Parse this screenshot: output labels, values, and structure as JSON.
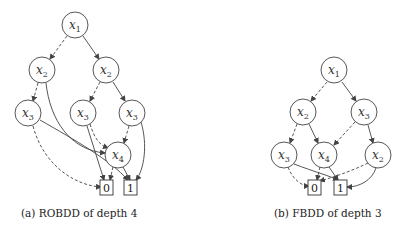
{
  "figures": [
    {
      "id": "a",
      "caption": "(a) ROBDD of depth 4",
      "nodes": [
        {
          "id": "a_x1",
          "var": "x",
          "sub": "1",
          "cx": 75,
          "cy": 25
        },
        {
          "id": "a_x2l",
          "var": "x",
          "sub": "2",
          "cx": 42,
          "cy": 70
        },
        {
          "id": "a_x2r",
          "var": "x",
          "sub": "2",
          "cx": 106,
          "cy": 70
        },
        {
          "id": "a_x3l",
          "var": "x",
          "sub": "3",
          "cx": 28,
          "cy": 113
        },
        {
          "id": "a_x3m",
          "var": "x",
          "sub": "3",
          "cx": 83,
          "cy": 113
        },
        {
          "id": "a_x3r",
          "var": "x",
          "sub": "3",
          "cx": 132,
          "cy": 113
        },
        {
          "id": "a_x4",
          "var": "x",
          "sub": "4",
          "cx": 118,
          "cy": 155
        }
      ],
      "terminals": [
        {
          "id": "a_0",
          "label": "0",
          "x": 106,
          "y": 186
        },
        {
          "id": "a_1",
          "label": "1",
          "x": 130,
          "y": 186
        }
      ]
    },
    {
      "id": "b",
      "caption": "(b) FBDD of depth 3",
      "nodes": [
        {
          "id": "b_x1",
          "var": "x",
          "sub": "1",
          "cx": 334,
          "cy": 70
        },
        {
          "id": "b_x2",
          "var": "x",
          "sub": "2",
          "cx": 303,
          "cy": 112
        },
        {
          "id": "b_x3",
          "var": "x",
          "sub": "3",
          "cx": 364,
          "cy": 112
        },
        {
          "id": "b_x3b",
          "var": "x",
          "sub": "3",
          "cx": 284,
          "cy": 155
        },
        {
          "id": "b_x4",
          "var": "x",
          "sub": "4",
          "cx": 324,
          "cy": 155
        },
        {
          "id": "b_x2b",
          "var": "x",
          "sub": "2",
          "cx": 378,
          "cy": 155
        }
      ],
      "terminals": [
        {
          "id": "b_0",
          "label": "0",
          "x": 314,
          "y": 186
        },
        {
          "id": "b_1",
          "label": "1",
          "x": 340,
          "y": 186
        }
      ]
    }
  ],
  "captions": {
    "a": "(a) ROBDD of depth 4",
    "b": "(b) FBDD of depth 3"
  },
  "legend": {
    "dashed_edge": "0-branch (low)",
    "solid_edge": "1-branch (high)"
  }
}
